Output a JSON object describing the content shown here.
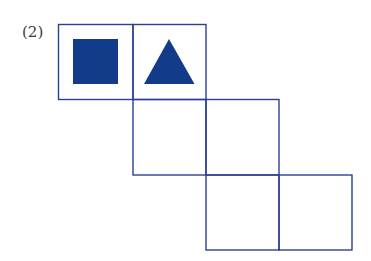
{
  "problem": {
    "label": "(2)"
  },
  "colors": {
    "line": "#2b3f93",
    "fill": "#123b8a"
  },
  "net": {
    "type": "cube-net",
    "cells": [
      {
        "row": 0,
        "col": 0,
        "symbol": "filled-square"
      },
      {
        "row": 0,
        "col": 1,
        "symbol": "filled-triangle"
      },
      {
        "row": 1,
        "col": 1,
        "symbol": null
      },
      {
        "row": 1,
        "col": 2,
        "symbol": null
      },
      {
        "row": 2,
        "col": 2,
        "symbol": null
      },
      {
        "row": 2,
        "col": 3,
        "symbol": null
      }
    ]
  }
}
